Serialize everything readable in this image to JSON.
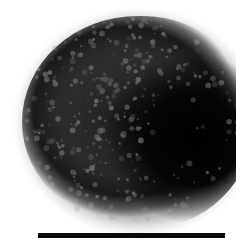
{
  "image": {
    "description": "Grayscale electron micrograph of a roughly spherical particle with granular surface texture",
    "background_color": "#ffffff",
    "particle_dark_color": "#000000",
    "particle_mid_color": "#3a3a3a",
    "speckle_color": "#9a9a9a"
  },
  "scale_bar": {
    "label": "",
    "color": "#0a0a0a"
  }
}
